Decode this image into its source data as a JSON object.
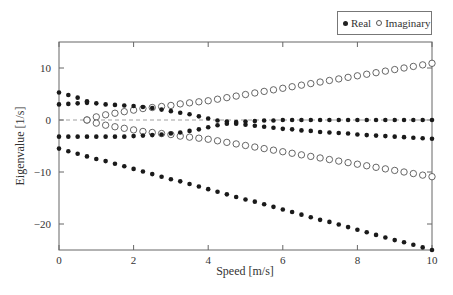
{
  "chart_data": {
    "type": "scatter",
    "title": "",
    "xlabel": "Speed [m/s]",
    "ylabel": "Eigenvalue [1/s]",
    "xlim": [
      0,
      10
    ],
    "ylim": [
      -25,
      15
    ],
    "xticks": [
      0,
      2,
      4,
      6,
      8,
      10
    ],
    "yticks": [
      -20,
      -10,
      0,
      10
    ],
    "grid": false,
    "zero_line": "dashed",
    "legend": {
      "position": "top-right-outside",
      "entries": [
        "Real",
        "Imaginary"
      ]
    },
    "x_step": 0.25,
    "series": [
      {
        "name": "Real",
        "marker": "filled-circle",
        "branches": [
          {
            "label": "mode-1",
            "x": [
              0,
              0.25,
              0.5,
              0.75
            ],
            "y": [
              5.3,
              4.8,
              4.3,
              3.6
            ]
          },
          {
            "label": "mode-2",
            "x": [
              0,
              0.25,
              0.5,
              0.75,
              1,
              1.25,
              1.5,
              1.75,
              2,
              2.25,
              2.5,
              2.75,
              3,
              3.25,
              3.5,
              3.75,
              4,
              4.25,
              4.5,
              4.75,
              5,
              5.25,
              5.5,
              5.75,
              6,
              6.25,
              6.5,
              6.75,
              7,
              7.25,
              7.5,
              7.75,
              8,
              8.25,
              8.5,
              8.75,
              9,
              9.25,
              9.5,
              9.75,
              10
            ],
            "y": [
              3.0,
              3.1,
              3.2,
              3.3,
              3.2,
              3.0,
              2.9,
              2.8,
              2.7,
              2.5,
              2.3,
              2.0,
              1.7,
              1.4,
              1.1,
              0.7,
              0.3,
              -0.1,
              -0.3,
              -0.4,
              -0.3,
              -0.2,
              -0.1,
              -0.1,
              0,
              0,
              0,
              0,
              0,
              0,
              0,
              0,
              0,
              0,
              0,
              0,
              0,
              0,
              0,
              0,
              0
            ]
          },
          {
            "label": "mode-3",
            "x": [
              0,
              0.25,
              0.5,
              0.75,
              1,
              1.25,
              1.5,
              1.75,
              2,
              2.25,
              2.5,
              2.75,
              3,
              3.25,
              3.5,
              3.75,
              4,
              4.25,
              4.5,
              4.75,
              5,
              5.25,
              5.5,
              5.75,
              6,
              6.25,
              6.5,
              6.75,
              7,
              7.25,
              7.5,
              7.75,
              8,
              8.25,
              8.5,
              8.75,
              9,
              9.25,
              9.5,
              9.75,
              10
            ],
            "y": [
              -3.2,
              -3.2,
              -3.2,
              -3.2,
              -3.2,
              -3.2,
              -3.2,
              -3.2,
              -3.1,
              -3.0,
              -2.9,
              -2.8,
              -2.6,
              -2.4,
              -2.1,
              -1.8,
              -1.4,
              -1.0,
              -0.7,
              -0.7,
              -0.9,
              -1.1,
              -1.3,
              -1.5,
              -1.7,
              -1.8,
              -2.0,
              -2.1,
              -2.3,
              -2.4,
              -2.5,
              -2.6,
              -2.8,
              -2.9,
              -3.0,
              -3.1,
              -3.2,
              -3.3,
              -3.4,
              -3.5,
              -3.6
            ]
          },
          {
            "label": "mode-4",
            "x": [
              0,
              0.25,
              0.5,
              0.75,
              1,
              1.25,
              1.5,
              1.75,
              2,
              2.25,
              2.5,
              2.75,
              3,
              3.25,
              3.5,
              3.75,
              4,
              4.25,
              4.5,
              4.75,
              5,
              5.25,
              5.5,
              5.75,
              6,
              6.25,
              6.5,
              6.75,
              7,
              7.25,
              7.5,
              7.75,
              8,
              8.25,
              8.5,
              8.75,
              9,
              9.25,
              9.5,
              9.75,
              10
            ],
            "y": [
              -5.5,
              -6.0,
              -6.5,
              -7.0,
              -7.5,
              -7.9,
              -8.4,
              -8.9,
              -9.4,
              -9.9,
              -10.4,
              -10.9,
              -11.4,
              -11.8,
              -12.3,
              -12.8,
              -13.3,
              -13.8,
              -14.3,
              -14.8,
              -15.3,
              -15.7,
              -16.2,
              -16.7,
              -17.2,
              -17.7,
              -18.2,
              -18.7,
              -19.2,
              -19.6,
              -20.1,
              -20.6,
              -21.1,
              -21.6,
              -22.1,
              -22.6,
              -23.1,
              -23.5,
              -24.0,
              -24.5,
              -25.0
            ]
          }
        ]
      },
      {
        "name": "Imaginary",
        "marker": "open-circle",
        "branches": [
          {
            "label": "positive",
            "x": [
              0.75,
              1,
              1.25,
              1.5,
              1.75,
              2,
              2.25,
              2.5,
              2.75,
              3,
              3.25,
              3.5,
              3.75,
              4,
              4.25,
              4.5,
              4.75,
              5,
              5.25,
              5.5,
              5.75,
              6,
              6.25,
              6.5,
              6.75,
              7,
              7.25,
              7.5,
              7.75,
              8,
              8.25,
              8.5,
              8.75,
              9,
              9.25,
              9.5,
              9.75,
              10
            ],
            "y": [
              0.0,
              0.6,
              1.0,
              1.3,
              1.6,
              1.9,
              2.2,
              2.4,
              2.6,
              2.8,
              3.1,
              3.3,
              3.5,
              3.7,
              4.0,
              4.3,
              4.6,
              4.9,
              5.2,
              5.5,
              5.8,
              6.1,
              6.4,
              6.7,
              7.0,
              7.3,
              7.6,
              7.9,
              8.2,
              8.5,
              8.8,
              9.1,
              9.4,
              9.7,
              10.0,
              10.3,
              10.6,
              10.9
            ]
          },
          {
            "label": "negative",
            "x": [
              0.75,
              1,
              1.25,
              1.5,
              1.75,
              2,
              2.25,
              2.5,
              2.75,
              3,
              3.25,
              3.5,
              3.75,
              4,
              4.25,
              4.5,
              4.75,
              5,
              5.25,
              5.5,
              5.75,
              6,
              6.25,
              6.5,
              6.75,
              7,
              7.25,
              7.5,
              7.75,
              8,
              8.25,
              8.5,
              8.75,
              9,
              9.25,
              9.5,
              9.75,
              10
            ],
            "y": [
              0.0,
              -0.6,
              -1.0,
              -1.3,
              -1.6,
              -1.9,
              -2.2,
              -2.4,
              -2.6,
              -2.8,
              -3.1,
              -3.3,
              -3.5,
              -3.7,
              -4.0,
              -4.3,
              -4.6,
              -4.9,
              -5.2,
              -5.5,
              -5.8,
              -6.1,
              -6.4,
              -6.7,
              -7.0,
              -7.3,
              -7.6,
              -7.9,
              -8.2,
              -8.5,
              -8.8,
              -9.1,
              -9.4,
              -9.7,
              -10.0,
              -10.3,
              -10.6,
              -10.9
            ]
          }
        ]
      }
    ]
  },
  "legend": {
    "real_label": "Real",
    "imaginary_label": "Imaginary"
  },
  "colors": {
    "axis": "#666666",
    "real_marker": "#1a1a1a",
    "imag_marker": "#555555",
    "zero_line": "#888888"
  }
}
